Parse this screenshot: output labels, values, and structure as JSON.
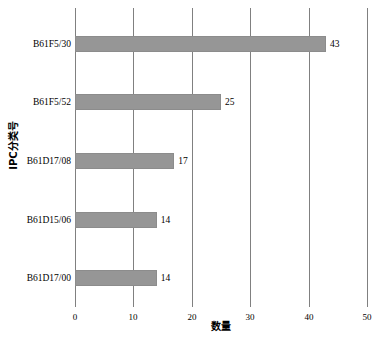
{
  "chart_data": {
    "type": "bar",
    "orientation": "horizontal",
    "title": "",
    "xlabel": "数量",
    "ylabel": "IPC分类号",
    "categories": [
      "B61F5/30",
      "B61F5/52",
      "B61D17/08",
      "B61D15/06",
      "B61D17/00"
    ],
    "values": [
      43,
      25,
      17,
      14,
      14
    ],
    "value_labels": [
      "43",
      "25",
      "17",
      "14",
      "14"
    ],
    "xlim": [
      0,
      50
    ],
    "xticks": [
      0,
      10,
      20,
      30,
      40,
      50
    ],
    "xtick_labels": [
      "0",
      "10",
      "20",
      "30",
      "40",
      "50"
    ],
    "grid": "vertical",
    "legend": "none",
    "bar_color": "#969696",
    "bar_edge_color": "#8c8c8c",
    "gridline_color": "#808080",
    "background_color": "#ffffff",
    "text_color": "#000000"
  }
}
